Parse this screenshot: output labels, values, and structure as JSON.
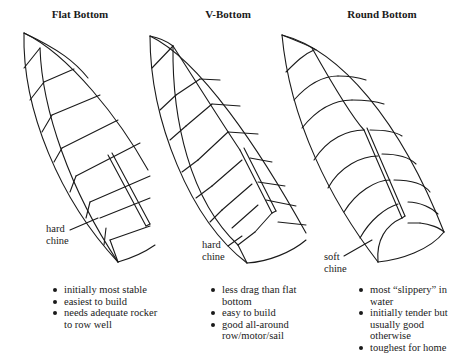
{
  "hulls": [
    {
      "title": "Flat Bottom",
      "chine_label": [
        "hard",
        "chine"
      ],
      "features": [
        "initially most stable",
        "easiest to build",
        "needs adequate rocker to row well"
      ]
    },
    {
      "title": "V-Bottom",
      "chine_label": [
        "hard",
        "chine"
      ],
      "features": [
        "less drag than flat bottom",
        "easy to build",
        "good all-around row/motor/sail"
      ]
    },
    {
      "title": "Round Bottom",
      "chine_label": [
        "soft",
        "chine"
      ],
      "features": [
        "most “slippery” in water",
        "initially tender but usually good otherwise",
        "toughest for home"
      ]
    }
  ]
}
